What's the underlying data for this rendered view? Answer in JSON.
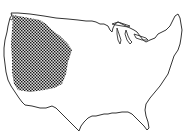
{
  "map": {
    "type": "outline-map",
    "region": "contiguous-united-states",
    "highlighted_region": {
      "description": "western United States (Pacific coast to Great Plains)",
      "fill_pattern": "crosshatch",
      "fill_color": "#2a2a2a"
    },
    "outline_color": "#3a3a3a",
    "background_color": "#ffffff",
    "labels": []
  }
}
